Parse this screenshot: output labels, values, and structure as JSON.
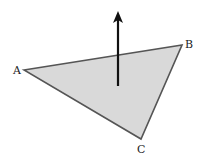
{
  "diagram": {
    "type": "triangle-with-normal-vector",
    "colors": {
      "fill": "#d9d9d9",
      "stroke": "#555555",
      "arrow": "#111111",
      "background": "#ffffff"
    },
    "vertices": [
      {
        "label": "A",
        "x": 24,
        "y": 70,
        "label_x": 13,
        "label_y": 74
      },
      {
        "label": "B",
        "x": 182,
        "y": 45,
        "label_x": 185,
        "label_y": 48
      },
      {
        "label": "C",
        "x": 141,
        "y": 139,
        "label_x": 137,
        "label_y": 153
      }
    ],
    "normal_arrow": {
      "x": 118,
      "y_start": 86,
      "y_tip": 11
    }
  }
}
